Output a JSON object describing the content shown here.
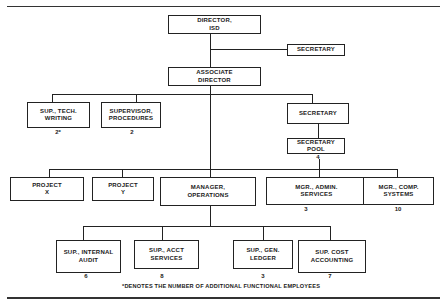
{
  "chart": {
    "nodes": {
      "director": {
        "line1": "DIRECTOR,",
        "line2": "ISD"
      },
      "secretary_top": {
        "line1": "SECRETARY"
      },
      "associate_director": {
        "line1": "ASSOCIATE",
        "line2": "DIRECTOR"
      },
      "sup_tech_writing": {
        "line1": "SUP., TECH.",
        "line2": "WRITING",
        "count": "2*"
      },
      "supervisor_procedures": {
        "line1": "SUPERVISOR,",
        "line2": "PROCEDURES",
        "count": "2"
      },
      "secretary_right": {
        "line1": "SECRETARY"
      },
      "secretary_pool": {
        "line1": "SECRETARY",
        "line2": "POOL",
        "count": "4"
      },
      "project_x": {
        "line1": "PROJECT",
        "line2": "X"
      },
      "project_y": {
        "line1": "PROJECT",
        "line2": "Y"
      },
      "manager_operations": {
        "line1": "MANAGER,",
        "line2": "OPERATIONS"
      },
      "mgr_admin_services": {
        "line1": "MGR., ADMIN.",
        "line2": "SERVICES",
        "count": "3"
      },
      "mgr_comp_systems": {
        "line1": "MGR., COMP.",
        "line2": "SYSTEMS",
        "count": "10"
      },
      "sup_internal_audit": {
        "line1": "SUP., INTERNAL",
        "line2": "AUDIT",
        "count": "6"
      },
      "sup_acct_services": {
        "line1": "SUP., ACCT",
        "line2": "SERVICES",
        "count": "8"
      },
      "sup_gen_ledger": {
        "line1": "SUP., GEN.",
        "line2": "LEDGER",
        "count": "3"
      },
      "sup_cost_accounting": {
        "line1": "SUP. COST",
        "line2": "ACCOUNTING",
        "count": "7"
      }
    },
    "footnote": "*DENOTES THE NUMBER OF ADDITIONAL FUNCTIONAL EMPLOYEES"
  }
}
